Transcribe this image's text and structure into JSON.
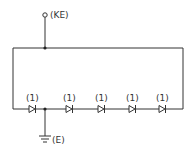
{
  "diagram": {
    "type": "circuit-schematic",
    "line_color": "#333333",
    "background": "#ffffff",
    "terminals": [
      {
        "id": "KE",
        "label": "(KE)",
        "kind": "open-terminal"
      },
      {
        "id": "E",
        "label": "(E)",
        "kind": "ground"
      }
    ],
    "diodes": [
      {
        "label": "(1)"
      },
      {
        "label": "(1)"
      },
      {
        "label": "(1)"
      },
      {
        "label": "(1)"
      },
      {
        "label": "(1)"
      }
    ]
  }
}
